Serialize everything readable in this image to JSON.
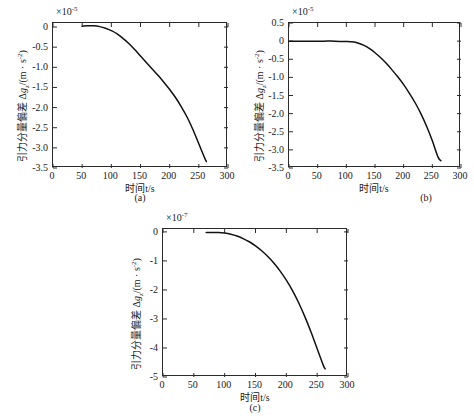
{
  "figure": {
    "background": "#ffffff",
    "curve_color": "#111111",
    "axis_color": "#2b2b2b"
  },
  "chart_data": [
    {
      "id": "a",
      "type": "line",
      "title": "",
      "caption": "(a)",
      "xlabel": "时间t/s",
      "ylabel": "引力分量偏差 Δg_z/(m · s⁻²)",
      "ylabel_prefix": "引力分量偏差 ",
      "ylabel_delta": "Δ",
      "ylabel_var": "g",
      "ylabel_sub": "z",
      "ylabel_unit": "/(m · s",
      "ylabel_unit_sup": "-2",
      "ylabel_unit_close": ")",
      "y_exponent_text": "×10",
      "y_exponent_sup": "-5",
      "xlim": [
        0,
        300
      ],
      "ylim": [
        -3.5,
        0.1
      ],
      "xticks": [
        0,
        50,
        100,
        150,
        200,
        250,
        300
      ],
      "xticklabels": [
        "0",
        "50",
        "100",
        "150",
        "200",
        "250",
        "300"
      ],
      "yticks": [
        0,
        -0.5,
        -1.0,
        -1.5,
        -2.0,
        -2.5,
        -3.0,
        -3.5
      ],
      "yticklabels": [
        "0",
        "-0.5",
        "-1.0",
        "-1.5",
        "-2.0",
        "-2.5",
        "-3.0",
        "-3.5"
      ],
      "grid": false,
      "legend": null,
      "series": [
        {
          "name": "Δgz deviation",
          "x": [
            50,
            60,
            70,
            80,
            90,
            100,
            110,
            120,
            130,
            140,
            150,
            160,
            170,
            180,
            190,
            200,
            210,
            220,
            230,
            240,
            250,
            260,
            263
          ],
          "y": [
            0.02,
            0.03,
            0.03,
            0.01,
            -0.03,
            -0.09,
            -0.17,
            -0.28,
            -0.41,
            -0.56,
            -0.72,
            -0.88,
            -1.04,
            -1.2,
            -1.37,
            -1.55,
            -1.75,
            -1.98,
            -2.24,
            -2.55,
            -2.9,
            -3.25,
            -3.34
          ]
        }
      ]
    },
    {
      "id": "b",
      "type": "line",
      "title": "",
      "caption": "(b)",
      "xlabel": "时间t/s",
      "ylabel": "引力分量偏差 Δg_z/(m · s⁻²)",
      "ylabel_prefix": "引力分量偏差 ",
      "ylabel_delta": "Δ",
      "ylabel_var": "g",
      "ylabel_sub": "z",
      "ylabel_unit": "/(m · s",
      "ylabel_unit_sup": "-2",
      "ylabel_unit_close": ")",
      "y_exponent_text": "×10",
      "y_exponent_sup": "-5",
      "xlim": [
        0,
        300
      ],
      "ylim": [
        -3.5,
        0.5
      ],
      "xticks": [
        0,
        50,
        100,
        150,
        200,
        250,
        300
      ],
      "xticklabels": [
        "0",
        "50",
        "100",
        "150",
        "200",
        "250",
        "300"
      ],
      "yticks": [
        0.5,
        0,
        -0.5,
        -1.0,
        -1.5,
        -2.0,
        -2.5,
        -3.0,
        -3.5
      ],
      "yticklabels": [
        "0.5",
        "0",
        "-0.5",
        "-1.0",
        "-1.5",
        "-2.0",
        "-2.5",
        "-3.0",
        "-3.5"
      ],
      "grid": false,
      "legend": null,
      "series": [
        {
          "name": "Δgz deviation",
          "x": [
            0,
            20,
            40,
            60,
            80,
            100,
            110,
            120,
            130,
            140,
            150,
            160,
            170,
            180,
            190,
            200,
            210,
            220,
            230,
            240,
            250,
            260,
            265
          ],
          "y": [
            0.0,
            0.0,
            0.0,
            0.0,
            0.0,
            -0.01,
            -0.02,
            -0.05,
            -0.11,
            -0.2,
            -0.32,
            -0.46,
            -0.62,
            -0.8,
            -0.99,
            -1.2,
            -1.44,
            -1.7,
            -2.0,
            -2.35,
            -2.75,
            -3.2,
            -3.3
          ]
        }
      ]
    },
    {
      "id": "c",
      "type": "line",
      "title": "",
      "caption": "(c)",
      "xlabel": "时间t/s",
      "ylabel": "引力分量偏差 Δg_z/(m · s⁻²)",
      "ylabel_prefix": "引力分量偏差 ",
      "ylabel_delta": "Δ",
      "ylabel_var": "g",
      "ylabel_sub": "z",
      "ylabel_unit": "/(m · s",
      "ylabel_unit_sup": "-2",
      "ylabel_unit_close": ")",
      "y_exponent_text": "×10",
      "y_exponent_sup": "-7",
      "xlim": [
        0,
        300
      ],
      "ylim": [
        -5,
        0.1
      ],
      "xticks": [
        0,
        50,
        100,
        150,
        200,
        250,
        300
      ],
      "xticklabels": [
        "0",
        "50",
        "100",
        "150",
        "200",
        "250",
        "300"
      ],
      "yticks": [
        0,
        -1,
        -2,
        -3,
        -4,
        -5
      ],
      "yticklabels": [
        "0",
        "-1",
        "-2",
        "-3",
        "-4",
        "-5"
      ],
      "grid": false,
      "legend": null,
      "series": [
        {
          "name": "Δgz deviation",
          "x": [
            70,
            80,
            90,
            100,
            110,
            120,
            130,
            140,
            150,
            160,
            170,
            180,
            190,
            200,
            210,
            220,
            230,
            240,
            250,
            260,
            263
          ],
          "y": [
            -0.02,
            -0.02,
            -0.02,
            -0.04,
            -0.08,
            -0.14,
            -0.23,
            -0.34,
            -0.48,
            -0.65,
            -0.85,
            -1.08,
            -1.35,
            -1.66,
            -2.02,
            -2.44,
            -2.92,
            -3.45,
            -4.03,
            -4.6,
            -4.72
          ]
        }
      ]
    }
  ]
}
